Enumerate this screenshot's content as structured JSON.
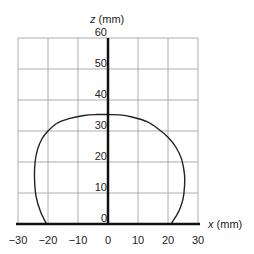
{
  "chart_data": {
    "type": "line",
    "title": "",
    "xlabel": "x (mm)",
    "ylabel": "z (mm)",
    "xlabel_var": "x",
    "xlabel_unit": " (mm)",
    "ylabel_var": "z",
    "ylabel_unit": " (mm)",
    "xlim": [
      -30,
      30
    ],
    "ylim": [
      0,
      60
    ],
    "grid": true,
    "x_ticks": [
      "−30",
      "−20",
      "−10",
      "0",
      "10",
      "20",
      "30"
    ],
    "y_ticks": [
      "0",
      "10",
      "20",
      "30",
      "40",
      "50",
      "60"
    ],
    "series": [
      {
        "name": "profile",
        "x": [
          -20.5,
          -22.5,
          -24,
          -24.5,
          -24.3,
          -23.5,
          -22,
          -20,
          -17,
          -13,
          -8,
          -4,
          0,
          4,
          8,
          13,
          17,
          20,
          22.5,
          24.5,
          25.5,
          25.5,
          25,
          24,
          23,
          21
        ],
        "z": [
          0,
          4,
          9,
          15,
          20,
          24,
          27.5,
          30,
          32.5,
          34,
          35,
          35.3,
          35.3,
          35.2,
          34.5,
          33,
          30.5,
          28,
          25,
          21,
          16,
          12,
          8,
          5,
          3,
          0
        ]
      }
    ]
  }
}
